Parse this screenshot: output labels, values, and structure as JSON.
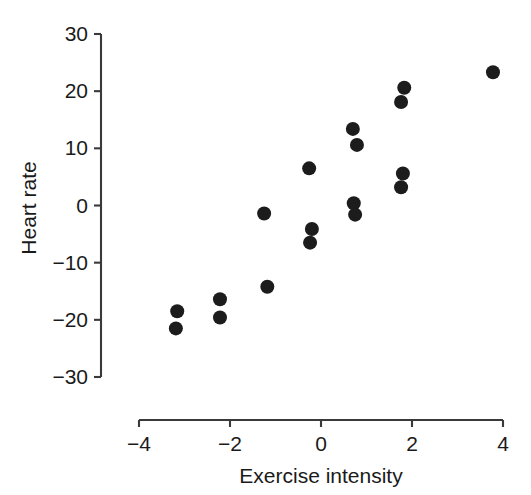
{
  "chart_data": {
    "type": "scatter",
    "title": "",
    "xlabel": "Exercise intensity",
    "ylabel": "Heart rate",
    "xlim": [
      -4,
      4
    ],
    "ylim": [
      -30,
      30
    ],
    "xticks": [
      -4,
      -2,
      0,
      2,
      4
    ],
    "yticks": [
      30,
      20,
      10,
      0,
      -10,
      -20,
      -30
    ],
    "xtick_labels": [
      "−4",
      "−2",
      "0",
      "2",
      "4"
    ],
    "ytick_labels": [
      "30",
      "20",
      "10",
      "0",
      "−10",
      "−20",
      "−30"
    ],
    "grid": false,
    "legend": false,
    "legend_position": "none",
    "marker": "filled-circle",
    "marker_color": "#1c1c1c",
    "marker_size_px": 7,
    "n_points": 18,
    "points": [
      {
        "x": -3.16,
        "y": -18.5
      },
      {
        "x": -3.19,
        "y": -21.5
      },
      {
        "x": -2.22,
        "y": -16.4
      },
      {
        "x": -2.22,
        "y": -19.6
      },
      {
        "x": -1.25,
        "y": -1.4
      },
      {
        "x": -1.18,
        "y": -14.2
      },
      {
        "x": -0.26,
        "y": 6.5
      },
      {
        "x": -0.2,
        "y": -4.1
      },
      {
        "x": -0.24,
        "y": -6.5
      },
      {
        "x": 0.7,
        "y": 13.4
      },
      {
        "x": 0.79,
        "y": 10.6
      },
      {
        "x": 0.72,
        "y": 0.4
      },
      {
        "x": 0.75,
        "y": -1.6
      },
      {
        "x": 1.83,
        "y": 20.6
      },
      {
        "x": 1.76,
        "y": 18.1
      },
      {
        "x": 1.8,
        "y": 5.6
      },
      {
        "x": 1.76,
        "y": 3.2
      },
      {
        "x": 3.78,
        "y": 23.3
      }
    ]
  },
  "axes": {
    "x_title": "Exercise intensity",
    "y_title": "Heart rate"
  },
  "colors": {
    "point": "#1c1c1c",
    "axis": "#3a3a3a",
    "text": "#1a1a1a",
    "background": "#ffffff"
  }
}
